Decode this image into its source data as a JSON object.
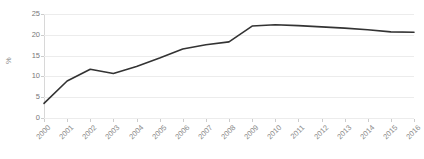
{
  "chart_data": {
    "type": "line",
    "title": "",
    "subtitle": "",
    "xlabel": "",
    "ylabel": "%",
    "categories": [
      "2000",
      "2001",
      "2002",
      "2003",
      "2004",
      "2005",
      "2006",
      "2007",
      "2008",
      "2009",
      "2010",
      "2011",
      "2012",
      "2013",
      "2014",
      "2015",
      "2016"
    ],
    "series": [
      {
        "name": "",
        "values": [
          3.5,
          8.9,
          11.7,
          10.7,
          12.4,
          14.4,
          16.6,
          17.6,
          18.3,
          22.1,
          22.4,
          22.2,
          21.9,
          21.6,
          21.2,
          20.7,
          20.6
        ],
        "color": "#333333"
      }
    ],
    "ylim": [
      0,
      25
    ],
    "yticks": [
      0,
      5,
      10,
      15,
      20,
      25
    ],
    "ytick_labels": [
      "0",
      "5",
      "10",
      "15",
      "20",
      "25"
    ],
    "grid": true,
    "grid_axis": "y",
    "grid_color": "#ececec",
    "legend": false,
    "legend_position": "none",
    "background_color": "#ffffff",
    "axis_color": "#d8d8d8",
    "tick_label_color": "#8a8a8a",
    "xtick_rotation": -45
  }
}
